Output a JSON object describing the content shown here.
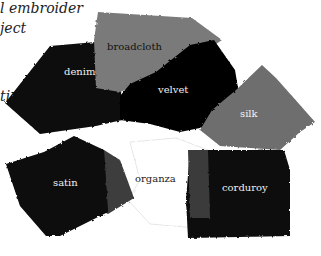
{
  "caption_lines": [
    "l embroider",
    "ject",
    "tion"
  ],
  "swatches": [
    {
      "name": "broadcloth",
      "color": "#7a7a7a",
      "label_color": "#111111"
    },
    {
      "name": "denim",
      "color": "#0a0a0a",
      "label_color": "#f0f0f0"
    },
    {
      "name": "velvet",
      "color": "#060606",
      "label_color": "#f0f0f0"
    },
    {
      "name": "silk",
      "color": "#6e6e6e",
      "label_color": "#f5f5f5"
    },
    {
      "name": "satin",
      "color": "#080808",
      "label_color": "#f0f0f0"
    },
    {
      "name": "organza",
      "color": "#ffffff",
      "label_color": "#222222"
    },
    {
      "name": "corduroy",
      "color": "#0a0a0a",
      "label_color": "#f0f0f0"
    }
  ]
}
